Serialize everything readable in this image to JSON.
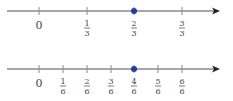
{
  "number_lines": [
    {
      "name": "thirds",
      "y": 11,
      "x_start": 7,
      "x_end": 220,
      "ticks": [
        {
          "x": 39,
          "num": "",
          "den": "",
          "whole": "0"
        },
        {
          "x": 87,
          "num": "1",
          "den": "3"
        },
        {
          "x": 134,
          "num": "2",
          "den": "3"
        },
        {
          "x": 182,
          "num": "3",
          "den": "3"
        }
      ],
      "marked_point": {
        "x": 134,
        "label": "2/3"
      }
    },
    {
      "name": "sixths",
      "y": 69,
      "x_start": 7,
      "x_end": 220,
      "ticks": [
        {
          "x": 39,
          "num": "",
          "den": "",
          "whole": "0"
        },
        {
          "x": 63,
          "num": "1",
          "den": "6"
        },
        {
          "x": 87,
          "num": "2",
          "den": "6"
        },
        {
          "x": 111,
          "num": "3",
          "den": "6"
        },
        {
          "x": 134,
          "num": "4",
          "den": "6"
        },
        {
          "x": 158,
          "num": "5",
          "den": "6"
        },
        {
          "x": 182,
          "num": "6",
          "den": "6"
        }
      ],
      "marked_point": {
        "x": 134,
        "label": "4/6"
      }
    }
  ],
  "colors": {
    "axis": "#8a8a8a",
    "point": "#1f3f9f",
    "text": "#444444"
  }
}
